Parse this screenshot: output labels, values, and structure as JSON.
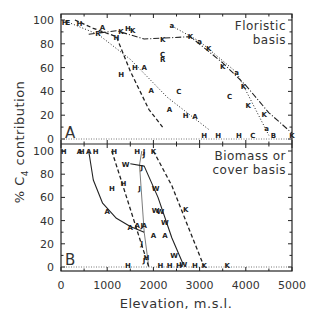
{
  "chart_data": [
    {
      "type": "line",
      "panel": "A",
      "note": [
        "Floristic",
        "basis"
      ],
      "xlabel": "Elevation, m.s.l.",
      "ylabel": "% C4 contribution",
      "xlim": [
        0,
        5000
      ],
      "ylim": [
        0,
        100
      ],
      "xticks": [
        0,
        1000,
        2000,
        3000,
        4000,
        5000
      ],
      "yticks": [
        0,
        20,
        40,
        60,
        80,
        100
      ],
      "grid": false,
      "series": [
        {
          "name": "K",
          "style": "dash-dot",
          "x": [
            600,
            1200,
            1800,
            2800,
            3500,
            4000,
            4500,
            5000
          ],
          "y": [
            88,
            91,
            84,
            86,
            64,
            45,
            22,
            5
          ]
        },
        {
          "name": "a",
          "style": "dotted",
          "x": [
            2400,
            3000,
            3800,
            4500
          ],
          "y": [
            95,
            82,
            56,
            3
          ]
        },
        {
          "name": "H-A dashed",
          "style": "dashed",
          "x": [
            300,
            700,
            1200,
            1500,
            1900,
            2200
          ],
          "y": [
            100,
            93,
            86,
            57,
            25,
            10
          ]
        },
        {
          "name": "C dotted",
          "style": "dotted",
          "x": [
            100,
            800,
            1500,
            2300,
            3200
          ],
          "y": [
            99,
            88,
            67,
            35,
            8
          ]
        }
      ],
      "markers": [
        {
          "label": "H",
          "x": 80,
          "y": 98
        },
        {
          "label": "E",
          "x": 150,
          "y": 98
        },
        {
          "label": "H",
          "x": 400,
          "y": 97
        },
        {
          "label": "A",
          "x": 900,
          "y": 94
        },
        {
          "label": "R",
          "x": 800,
          "y": 89
        },
        {
          "label": "H",
          "x": 1200,
          "y": 85
        },
        {
          "label": "K",
          "x": 1300,
          "y": 90
        },
        {
          "label": "H",
          "x": 1450,
          "y": 93
        },
        {
          "label": "K",
          "x": 1550,
          "y": 91
        },
        {
          "label": "K",
          "x": 2200,
          "y": 84
        },
        {
          "label": "K",
          "x": 2800,
          "y": 86
        },
        {
          "label": "C",
          "x": 2200,
          "y": 71
        },
        {
          "label": "R",
          "x": 2200,
          "y": 67
        },
        {
          "label": "H",
          "x": 1600,
          "y": 60
        },
        {
          "label": "A",
          "x": 1800,
          "y": 60
        },
        {
          "label": "H",
          "x": 1300,
          "y": 54
        },
        {
          "label": "A",
          "x": 1950,
          "y": 41
        },
        {
          "label": "C",
          "x": 2550,
          "y": 40
        },
        {
          "label": "A",
          "x": 2350,
          "y": 25
        },
        {
          "label": "H",
          "x": 2700,
          "y": 20
        },
        {
          "label": "A",
          "x": 2900,
          "y": 19
        },
        {
          "label": "a",
          "x": 2400,
          "y": 95
        },
        {
          "label": "a",
          "x": 3000,
          "y": 82
        },
        {
          "label": "K",
          "x": 3200,
          "y": 76
        },
        {
          "label": "K",
          "x": 3500,
          "y": 61
        },
        {
          "label": "a",
          "x": 3800,
          "y": 56
        },
        {
          "label": "K",
          "x": 3950,
          "y": 44
        },
        {
          "label": "C",
          "x": 3650,
          "y": 36
        },
        {
          "label": "K",
          "x": 4050,
          "y": 28
        },
        {
          "label": "K",
          "x": 4400,
          "y": 21
        },
        {
          "label": "a",
          "x": 4450,
          "y": 9
        },
        {
          "label": "B",
          "x": 4600,
          "y": 3
        },
        {
          "label": "K",
          "x": 5000,
          "y": 3
        },
        {
          "label": "H",
          "x": 3100,
          "y": 3
        },
        {
          "label": "H",
          "x": 3400,
          "y": 3
        },
        {
          "label": "H",
          "x": 3850,
          "y": 3
        },
        {
          "label": "C",
          "x": 4150,
          "y": 3
        }
      ]
    },
    {
      "type": "line",
      "panel": "B",
      "note": [
        "Biomass or",
        "cover basis"
      ],
      "xlabel": "Elevation, m.s.l.",
      "ylabel": "% C4 contribution",
      "xlim": [
        0,
        5000
      ],
      "ylim": [
        0,
        100
      ],
      "xticks": [
        0,
        1000,
        2000,
        3000,
        4000,
        5000
      ],
      "yticks": [
        0,
        20,
        40,
        60,
        80,
        100
      ],
      "grid": false,
      "series": [
        {
          "name": "A solid",
          "style": "solid",
          "x": [
            600,
            700,
            900,
            1200,
            1500,
            1800
          ],
          "y": [
            100,
            75,
            55,
            42,
            35,
            30
          ]
        },
        {
          "name": "H dashed",
          "style": "dashed",
          "x": [
            1100,
            1300,
            1500,
            1700,
            1900
          ],
          "y": [
            100,
            75,
            50,
            25,
            0
          ]
        },
        {
          "name": "J dotted-thin",
          "style": "thin",
          "x": [
            1750,
            1700,
            1800,
            1900
          ],
          "y": [
            100,
            88,
            30,
            0
          ]
        },
        {
          "name": "W solid",
          "style": "solid",
          "x": [
            1500,
            1800,
            2100,
            2400,
            2650
          ],
          "y": [
            89,
            87,
            60,
            25,
            2
          ]
        },
        {
          "name": "K dashed",
          "style": "dashed",
          "x": [
            2000,
            2400,
            2700,
            3100
          ],
          "y": [
            100,
            70,
            40,
            0
          ]
        }
      ],
      "markers": [
        {
          "label": "H",
          "x": 60,
          "y": 100
        },
        {
          "label": "A",
          "x": 400,
          "y": 100
        },
        {
          "label": "H",
          "x": 450,
          "y": 100
        },
        {
          "label": "A",
          "x": 600,
          "y": 100
        },
        {
          "label": "H",
          "x": 750,
          "y": 100
        },
        {
          "label": "H",
          "x": 1150,
          "y": 100
        },
        {
          "label": "H",
          "x": 1650,
          "y": 100
        },
        {
          "label": "J",
          "x": 1800,
          "y": 100
        },
        {
          "label": "J",
          "x": 1800,
          "y": 97
        },
        {
          "label": "K",
          "x": 2000,
          "y": 100
        },
        {
          "label": "W",
          "x": 1400,
          "y": 88
        },
        {
          "label": "J",
          "x": 1750,
          "y": 86
        },
        {
          "label": "H",
          "x": 1100,
          "y": 68
        },
        {
          "label": "H",
          "x": 1350,
          "y": 72
        },
        {
          "label": "J",
          "x": 1700,
          "y": 68
        },
        {
          "label": "W",
          "x": 2050,
          "y": 68
        },
        {
          "label": "A",
          "x": 1000,
          "y": 48
        },
        {
          "label": "W",
          "x": 2050,
          "y": 49
        },
        {
          "label": "W",
          "x": 2150,
          "y": 48
        },
        {
          "label": "K",
          "x": 2700,
          "y": 50
        },
        {
          "label": "W",
          "x": 2250,
          "y": 38
        },
        {
          "label": "A",
          "x": 1500,
          "y": 34
        },
        {
          "label": "A",
          "x": 1650,
          "y": 36
        },
        {
          "label": "J",
          "x": 1750,
          "y": 36
        },
        {
          "label": "A",
          "x": 1800,
          "y": 36
        },
        {
          "label": "A",
          "x": 2000,
          "y": 27
        },
        {
          "label": "A",
          "x": 2250,
          "y": 27
        },
        {
          "label": "J",
          "x": 1750,
          "y": 20
        },
        {
          "label": "W",
          "x": 2450,
          "y": 10
        },
        {
          "label": "J",
          "x": 1800,
          "y": 6
        },
        {
          "label": "H",
          "x": 1850,
          "y": 8
        },
        {
          "label": "H",
          "x": 1450,
          "y": 1
        },
        {
          "label": "H",
          "x": 2150,
          "y": 1
        },
        {
          "label": "H",
          "x": 2350,
          "y": 1
        },
        {
          "label": "H",
          "x": 2550,
          "y": 1
        },
        {
          "label": "W",
          "x": 2650,
          "y": 2
        },
        {
          "label": "H",
          "x": 2900,
          "y": 1
        },
        {
          "label": "K",
          "x": 3100,
          "y": 1
        },
        {
          "label": "K",
          "x": 3600,
          "y": 1
        }
      ]
    }
  ],
  "axes": {
    "xlabel": "Elevation, m.s.l.",
    "ylabel_prefix": "% C",
    "ylabel_sub": "4",
    "ylabel_suffix": " contribution",
    "xtick_labels": [
      "0",
      "1000",
      "2000",
      "3000",
      "4000",
      "5000"
    ],
    "ytick_labels": [
      "0",
      "20",
      "40",
      "60",
      "80",
      "100"
    ]
  }
}
